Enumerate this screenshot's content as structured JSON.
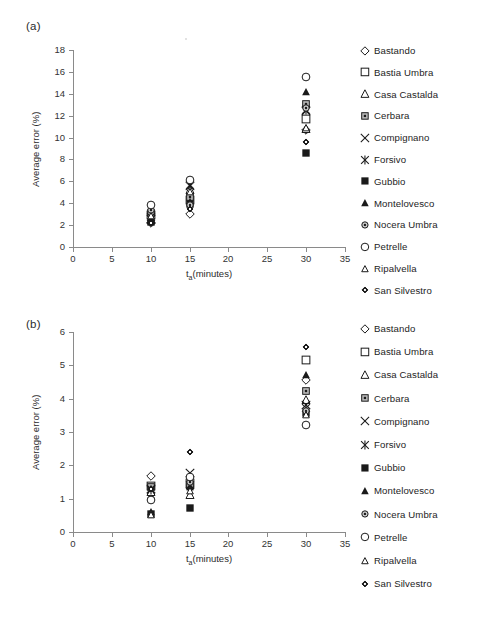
{
  "figure": {
    "panel_a_label": "(a)",
    "panel_b_label": "(b)"
  },
  "legend": {
    "entries": [
      {
        "label": "Bastando",
        "marker": "diamond-open"
      },
      {
        "label": "Bastia Umbra",
        "marker": "square-open"
      },
      {
        "label": "Casa Castalda",
        "marker": "triangle-open"
      },
      {
        "label": "Cerbara",
        "marker": "square-dotted"
      },
      {
        "label": "Compignano",
        "marker": "x-cross"
      },
      {
        "label": "Forsivo",
        "marker": "asterisk"
      },
      {
        "label": "Gubbio",
        "marker": "square-filled"
      },
      {
        "label": "Montelovesco",
        "marker": "triangle-filled"
      },
      {
        "label": "Nocera Umbra",
        "marker": "circle-dotted"
      },
      {
        "label": "Petrelle",
        "marker": "circle-open"
      },
      {
        "label": "Ripalvella",
        "marker": "triangle-small-open"
      },
      {
        "label": "San Silvestro",
        "marker": "diamond-filled"
      }
    ]
  },
  "chart_data": [
    {
      "type": "scatter",
      "panel": "(a)",
      "title": "",
      "xlabel": "ta(minutes)",
      "ylabel": "Average error (%)",
      "xlim": [
        0,
        35
      ],
      "ylim": [
        0,
        18
      ],
      "xticks": [
        0,
        5,
        10,
        15,
        20,
        25,
        30,
        35
      ],
      "yticks": [
        0,
        2,
        4,
        6,
        8,
        10,
        12,
        14,
        16,
        18
      ],
      "x": [
        10,
        15,
        30
      ],
      "grid": false,
      "legend_position": "right",
      "series": [
        {
          "name": "Bastando",
          "marker": "diamond-open",
          "values": [
            2.2,
            3.0,
            10.7
          ]
        },
        {
          "name": "Bastia Umbra",
          "marker": "square-open",
          "values": [
            2.9,
            4.3,
            11.7
          ]
        },
        {
          "name": "Casa Castalda",
          "marker": "triangle-open",
          "values": [
            2.5,
            5.2,
            10.8
          ]
        },
        {
          "name": "Cerbara",
          "marker": "square-dotted",
          "values": [
            3.1,
            4.6,
            13.1
          ]
        },
        {
          "name": "Compignano",
          "marker": "x-cross",
          "values": [
            2.6,
            5.6,
            12.4
          ]
        },
        {
          "name": "Forsivo",
          "marker": "asterisk",
          "values": [
            2.7,
            5.7,
            12.5
          ]
        },
        {
          "name": "Gubbio",
          "marker": "square-filled",
          "values": [
            2.3,
            3.9,
            8.6
          ]
        },
        {
          "name": "Montelovesco",
          "marker": "triangle-filled",
          "values": [
            2.4,
            4.1,
            14.2
          ]
        },
        {
          "name": "Nocera Umbra",
          "marker": "circle-dotted",
          "values": [
            3.4,
            3.8,
            12.7
          ]
        },
        {
          "name": "Petrelle",
          "marker": "circle-open",
          "values": [
            3.8,
            6.1,
            15.5
          ]
        },
        {
          "name": "Ripalvella",
          "marker": "triangle-small-open",
          "values": [
            2.8,
            5.0,
            10.9
          ]
        },
        {
          "name": "San Silvestro",
          "marker": "diamond-filled",
          "values": [
            2.2,
            3.5,
            9.6
          ]
        }
      ]
    },
    {
      "type": "scatter",
      "panel": "(b)",
      "title": "",
      "xlabel": "ta(minutes)",
      "ylabel": "Average error (%)",
      "xlim": [
        0,
        35
      ],
      "ylim": [
        0,
        6
      ],
      "xticks": [
        0,
        5,
        10,
        15,
        20,
        25,
        30,
        35
      ],
      "yticks": [
        0,
        1,
        2,
        3,
        4,
        5,
        6
      ],
      "x": [
        10,
        15,
        30
      ],
      "grid": false,
      "legend_position": "right",
      "series": [
        {
          "name": "Bastando",
          "marker": "diamond-open",
          "values": [
            1.68,
            1.32,
            4.55
          ]
        },
        {
          "name": "Bastia Umbra",
          "marker": "square-open",
          "values": [
            1.38,
            1.46,
            5.15
          ]
        },
        {
          "name": "Casa Castalda",
          "marker": "triangle-open",
          "values": [
            1.2,
            1.12,
            3.95
          ]
        },
        {
          "name": "Cerbara",
          "marker": "square-dotted",
          "values": [
            1.34,
            1.42,
            4.22
          ]
        },
        {
          "name": "Compignano",
          "marker": "x-cross",
          "values": [
            1.28,
            1.76,
            3.8
          ]
        },
        {
          "name": "Forsivo",
          "marker": "asterisk",
          "values": [
            1.26,
            1.4,
            3.72
          ]
        },
        {
          "name": "Gubbio",
          "marker": "square-filled",
          "values": [
            0.55,
            0.72,
            3.58
          ]
        },
        {
          "name": "Montelovesco",
          "marker": "triangle-filled",
          "values": [
            0.6,
            1.34,
            4.7
          ]
        },
        {
          "name": "Nocera Umbra",
          "marker": "circle-dotted",
          "values": [
            1.0,
            1.5,
            3.62
          ]
        },
        {
          "name": "Petrelle",
          "marker": "circle-open",
          "values": [
            0.97,
            1.66,
            3.2
          ]
        },
        {
          "name": "Ripalvella",
          "marker": "triangle-small-open",
          "values": [
            0.52,
            1.22,
            3.52
          ]
        },
        {
          "name": "San Silvestro",
          "marker": "diamond-filled",
          "values": [
            1.3,
            2.4,
            5.55
          ]
        }
      ]
    }
  ]
}
